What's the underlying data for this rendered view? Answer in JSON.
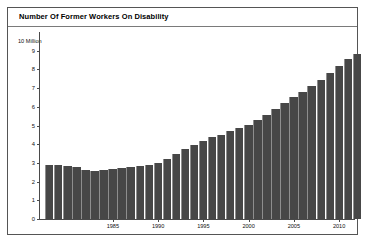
{
  "figure": {
    "title": "Number Of Former Workers On Disability",
    "unit_label": "10 Million"
  },
  "chart_data": {
    "type": "bar",
    "title": "Number Of Former Workers On Disability",
    "subtitle": "",
    "xlabel": "",
    "ylabel": "10 Million",
    "ylim": [
      0,
      10
    ],
    "ytick_labels": [
      "0",
      "1",
      "2",
      "3",
      "4",
      "5",
      "6",
      "7",
      "8",
      "9"
    ],
    "ytick_values": [
      0,
      1,
      2,
      3,
      4,
      5,
      6,
      7,
      8,
      9
    ],
    "xtick_labels": [
      "1985",
      "1990",
      "1995",
      "2000",
      "2005",
      "2010"
    ],
    "xtick_values": [
      1985,
      1990,
      1995,
      2000,
      2005,
      2010
    ],
    "grid": false,
    "legend": false,
    "bar_color": "#474747",
    "categories": [
      1978,
      1979,
      1980,
      1981,
      1982,
      1983,
      1984,
      1985,
      1986,
      1987,
      1988,
      1989,
      1990,
      1991,
      1992,
      1993,
      1994,
      1995,
      1996,
      1997,
      1998,
      1999,
      2000,
      2001,
      2002,
      2003,
      2004,
      2005,
      2006,
      2007,
      2008,
      2009,
      2010,
      2011,
      2012
    ],
    "values": [
      2.87,
      2.87,
      2.86,
      2.76,
      2.6,
      2.57,
      2.6,
      2.66,
      2.73,
      2.79,
      2.83,
      2.9,
      3.01,
      3.19,
      3.47,
      3.73,
      3.96,
      4.19,
      4.38,
      4.51,
      4.7,
      4.88,
      5.04,
      5.27,
      5.54,
      5.87,
      6.2,
      6.52,
      6.81,
      7.1,
      7.43,
      7.79,
      8.2,
      8.58,
      8.83
    ],
    "value_unit": "million workers"
  }
}
